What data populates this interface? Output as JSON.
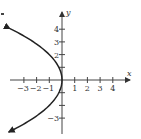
{
  "chart_data": {
    "type": "line",
    "title": "",
    "xlabel": "x",
    "ylabel": "y",
    "equation": "x = -y^2/4",
    "xlim": [
      -4,
      5
    ],
    "ylim": [
      -4.2,
      5.3
    ],
    "grid": false,
    "legend": null,
    "x_ticks": [
      -3,
      -2,
      -1,
      1,
      2,
      3,
      4
    ],
    "x_tick_labels": [
      "−3",
      "−2",
      "−1",
      "1",
      "2",
      "3",
      "4"
    ],
    "y_ticks": [
      -3,
      -2,
      -1,
      1,
      2,
      3,
      4
    ],
    "y_tick_labels": [
      {
        "value": 4,
        "label": "4"
      },
      {
        "value": 3,
        "label": "3"
      },
      {
        "value": 2,
        "label": "2"
      },
      {
        "value": -3,
        "label": "−3"
      }
    ],
    "series": [
      {
        "name": "parabola",
        "points": [
          {
            "y": -4,
            "x": -4
          },
          {
            "y": -3,
            "x": -2.25
          },
          {
            "y": -2,
            "x": -1
          },
          {
            "y": -1,
            "x": -0.25
          },
          {
            "y": 0,
            "x": 0
          },
          {
            "y": 1,
            "x": -0.25
          },
          {
            "y": 2,
            "x": -1
          },
          {
            "y": 3,
            "x": -2.25
          },
          {
            "y": 4,
            "x": -4
          }
        ],
        "arrows_at_ends": true,
        "color": "#222222"
      }
    ]
  },
  "colors": {
    "axis": "#444444",
    "curve": "#222222",
    "text": "#333333"
  }
}
